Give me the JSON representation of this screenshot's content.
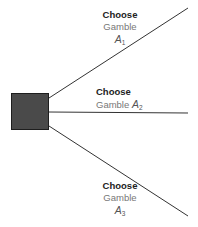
{
  "diagram": {
    "type": "decision-tree",
    "decision_node": {
      "shape": "square",
      "fill": "#4a4a4a"
    },
    "branches": [
      {
        "choose": "Choose",
        "gamble": "Gamble",
        "symbol": "A",
        "subscript": "1"
      },
      {
        "choose": "Choose",
        "gamble": "Gamble",
        "symbol": "A",
        "subscript": "2"
      },
      {
        "choose": "Choose",
        "gamble": "Gamble",
        "symbol": "A",
        "subscript": "3"
      }
    ]
  }
}
